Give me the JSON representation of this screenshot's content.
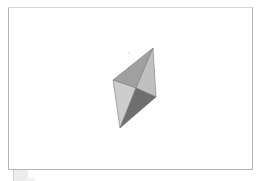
{
  "viewport": {
    "frame_color": "#b4b4b4",
    "background": "#ffffff"
  },
  "model": {
    "name": "octahedron-like bipyramid",
    "vertices": {
      "top": [
        153,
        48
      ],
      "left": [
        113,
        80
      ],
      "center": [
        136,
        88
      ],
      "right": [
        156,
        97
      ],
      "bottom": [
        120,
        128
      ]
    },
    "faces": [
      {
        "name": "upper-left-face",
        "points": [
          "top",
          "left",
          "center"
        ],
        "color": "#a0a0a0"
      },
      {
        "name": "upper-right-face",
        "points": [
          "top",
          "center",
          "right"
        ],
        "color": "#c0c0c0"
      },
      {
        "name": "lower-left-face",
        "points": [
          "left",
          "center",
          "bottom"
        ],
        "color": "#cdcdcd"
      },
      {
        "name": "lower-right-face",
        "points": [
          "center",
          "right",
          "bottom"
        ],
        "color": "#6e6e6e"
      }
    ],
    "edge_color": "#7a7a7a"
  },
  "status": {
    "thumbnail_color": "#ececec"
  }
}
